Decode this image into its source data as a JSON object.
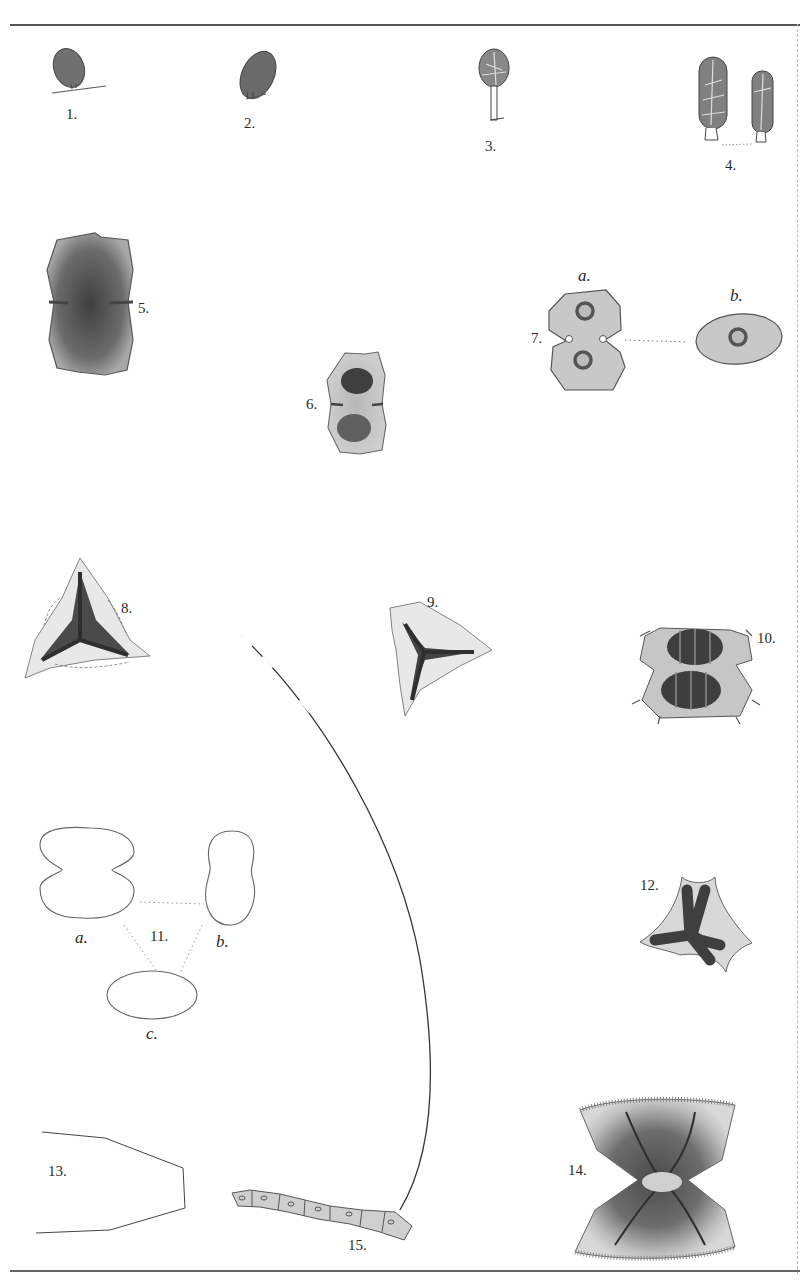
{
  "plate": {
    "figures": [
      {
        "id": "fig-1",
        "label": "1."
      },
      {
        "id": "fig-2",
        "label": "2."
      },
      {
        "id": "fig-3",
        "label": "3."
      },
      {
        "id": "fig-4",
        "label": "4."
      },
      {
        "id": "fig-5",
        "label": "5."
      },
      {
        "id": "fig-6",
        "label": "6."
      },
      {
        "id": "fig-7",
        "label": "7.",
        "sublabels": [
          "a.",
          "b."
        ]
      },
      {
        "id": "fig-8",
        "label": "8."
      },
      {
        "id": "fig-9",
        "label": "9."
      },
      {
        "id": "fig-10",
        "label": "10."
      },
      {
        "id": "fig-11",
        "label": "11.",
        "sublabels": [
          "a.",
          "b.",
          "c."
        ]
      },
      {
        "id": "fig-12",
        "label": "12."
      },
      {
        "id": "fig-13",
        "label": "13."
      },
      {
        "id": "fig-14",
        "label": "14."
      },
      {
        "id": "fig-15",
        "label": "15."
      }
    ]
  },
  "colors": {
    "ink": "#2b2b2b",
    "stipple_dark": "#555555",
    "stipple_light": "#bdbdbd",
    "paper": "#ffffff"
  }
}
